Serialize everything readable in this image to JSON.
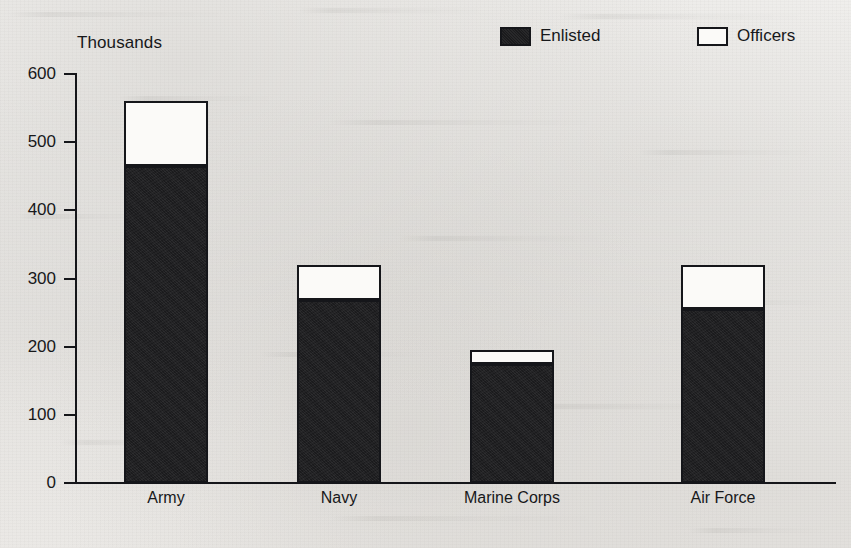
{
  "chart_data": {
    "type": "bar",
    "subtype": "stacked-bar",
    "title": "",
    "xlabel": "",
    "ylabel": "Thousands",
    "ylim": [
      0,
      600
    ],
    "yticks": [
      0,
      100,
      200,
      300,
      400,
      500,
      600
    ],
    "ytick_labels": [
      "0",
      "100",
      "200",
      "300",
      "400",
      "500",
      "600"
    ],
    "grid": false,
    "legend_position": "top-right",
    "categories": [
      "Army",
      "Navy",
      "Marine Corps",
      "Air Force"
    ],
    "series": [
      {
        "name": "Enlisted",
        "color": "#1b1b1d",
        "values": [
          465,
          268,
          175,
          255
        ]
      },
      {
        "name": "Officers",
        "color": "#ffffff",
        "values": [
          95,
          52,
          20,
          65
        ]
      }
    ],
    "totals": [
      560,
      320,
      195,
      320
    ]
  },
  "axis": {
    "unit_label": "Thousands"
  },
  "legend": {
    "items": [
      {
        "label": "Enlisted",
        "swatch": "filled"
      },
      {
        "label": "Officers",
        "swatch": "hollow"
      }
    ]
  }
}
